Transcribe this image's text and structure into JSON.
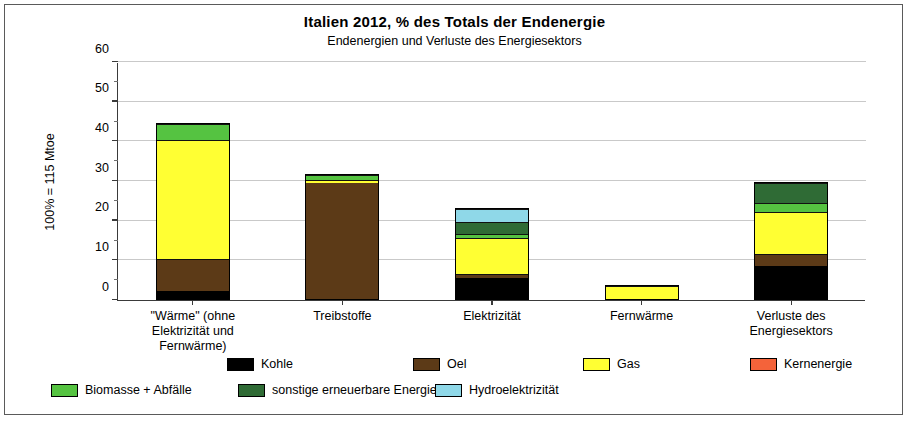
{
  "header": {
    "title": "Italien  2012, % des Totals der Endenergie",
    "subtitle": "Endenergien und Verluste des Energiesektors"
  },
  "axis": {
    "y_title": "100% = 115 Mtoe",
    "y_ticks": [
      "0",
      "10",
      "20",
      "30",
      "40",
      "50",
      "60"
    ]
  },
  "legend": {
    "row1": [
      {
        "label": "Kohle",
        "color": "#000000"
      },
      {
        "label": "Oel",
        "color": "#5c3a17"
      },
      {
        "label": "Gas",
        "color": "#ffff33"
      },
      {
        "label": "Kernenergie",
        "color": "#f4633a"
      }
    ],
    "row2": [
      {
        "label": "Biomasse + Abfälle",
        "color": "#55c341"
      },
      {
        "label": "sonstige erneuerbare Energie",
        "color": "#2f6b35"
      },
      {
        "label": "Hydroelektrizität",
        "color": "#8fd8e8"
      }
    ]
  },
  "chart_data": {
    "type": "bar",
    "stacked": true,
    "title": "Italien  2012, % des Totals der Endenergie",
    "subtitle": "Endenergien und Verluste des Energiesektors",
    "xlabel": "",
    "ylabel": "100% = 115 Mtoe",
    "ylim": [
      0,
      60
    ],
    "ytick_step": 10,
    "yminor_step": 5,
    "grid": true,
    "legend_position": "bottom",
    "categories": [
      "\"Wärme\" (ohne Elektrizität und Fernwärme)",
      "Treibstoffe",
      "Elektrizität",
      "Fernwärme",
      "Verluste des Energiesektors"
    ],
    "category_lines": [
      [
        "\"Wärme\" (ohne",
        "Elektrizität und",
        "Fernwärme)"
      ],
      [
        "Treibstoffe"
      ],
      [
        "Elektrizität"
      ],
      [
        "Fernwärme"
      ],
      [
        "Verluste des",
        "Energiesektors"
      ]
    ],
    "series": [
      {
        "name": "Kohle",
        "color": "#000000",
        "values": [
          2.1,
          0.0,
          5.2,
          0.0,
          8.3
        ]
      },
      {
        "name": "Oel",
        "color": "#5c3a17",
        "values": [
          8.0,
          29.3,
          1.0,
          0.0,
          3.0
        ]
      },
      {
        "name": "Gas",
        "color": "#ffff33",
        "values": [
          30.0,
          0.6,
          9.3,
          3.0,
          10.7
        ]
      },
      {
        "name": "Kernenergie",
        "color": "#f4633a",
        "values": [
          0.0,
          0.0,
          0.0,
          0.0,
          0.0
        ]
      },
      {
        "name": "Biomasse + Abfälle",
        "color": "#55c341",
        "values": [
          3.9,
          1.4,
          0.8,
          0.3,
          2.3
        ]
      },
      {
        "name": "sonstige erneuerbare Energie",
        "color": "#2f6b35",
        "values": [
          0.0,
          0.0,
          3.2,
          0.0,
          5.0
        ]
      },
      {
        "name": "Hydroelektrizität",
        "color": "#8fd8e8",
        "values": [
          0.0,
          0.0,
          3.2,
          0.0,
          0.0
        ]
      }
    ],
    "totals": [
      44.0,
      31.3,
      22.7,
      3.3,
      29.3
    ]
  }
}
